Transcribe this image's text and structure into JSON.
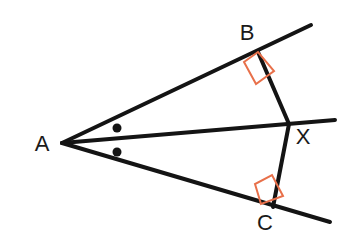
{
  "figure": {
    "background_color": "#ffffff",
    "stroke_color": "#141414",
    "right_angle_color": "#e8704a",
    "label_color": "#1a1a1a",
    "canvas": {
      "width": 350,
      "height": 246
    }
  },
  "points": [
    {
      "id": "A",
      "label": "A",
      "x": 62,
      "y": 143,
      "label_x": 42,
      "label_y": 145
    },
    {
      "id": "B",
      "label": "B",
      "x": 258,
      "y": 52,
      "label_x": 247,
      "label_y": 34
    },
    {
      "id": "X",
      "label": "X",
      "x": 289,
      "y": 124,
      "label_x": 303,
      "label_y": 138
    },
    {
      "id": "C",
      "label": "C",
      "x": 273,
      "y": 207,
      "label_x": 265,
      "label_y": 224
    }
  ],
  "segments": [
    {
      "id": "ray-AB",
      "name": "upper-ray",
      "x1": 62,
      "y1": 143,
      "x2": 311,
      "y2": 25,
      "width": 4
    },
    {
      "id": "ray-AX",
      "name": "bisector-ray",
      "x1": 62,
      "y1": 143,
      "x2": 335,
      "y2": 120,
      "width": 4
    },
    {
      "id": "ray-AC",
      "name": "lower-ray",
      "x1": 62,
      "y1": 143,
      "x2": 330,
      "y2": 222,
      "width": 4
    },
    {
      "id": "seg-BX",
      "name": "perpendicular-B-to-X",
      "x1": 258,
      "y1": 52,
      "x2": 289,
      "y2": 124,
      "width": 4
    },
    {
      "id": "seg-CX",
      "name": "perpendicular-C-to-X",
      "x1": 289,
      "y1": 124,
      "x2": 273,
      "y2": 207,
      "width": 4
    }
  ],
  "right_angles": [
    {
      "id": "right-angle-B",
      "vertex": "B",
      "points": "244,62 256,84 274,71 258,52",
      "size": 20
    },
    {
      "id": "right-angle-C",
      "vertex": "C",
      "points": "255,184 261,204 283,196 272,175",
      "size": 20
    }
  ],
  "angle_marks": [
    {
      "id": "angle-mark-upper",
      "name": "congruent-angle-dot-upper",
      "cx": 117,
      "cy": 128,
      "r": 4.5
    },
    {
      "id": "angle-mark-lower",
      "name": "congruent-angle-dot-lower",
      "cx": 117,
      "cy": 152,
      "r": 4.5
    }
  ]
}
